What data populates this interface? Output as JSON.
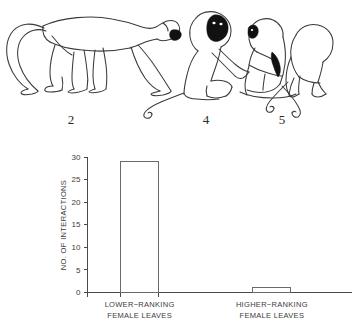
{
  "figure": {
    "illustration": {
      "panels": [
        {
          "number": "2",
          "caption_icon": "monkey-walking-icon"
        },
        {
          "number": "4",
          "caption_icon": "monkey-pair-grooming-icon"
        },
        {
          "number": "5",
          "caption_icon": "monkey-sitting-icon"
        }
      ]
    }
  },
  "chart_data": {
    "type": "bar",
    "title": "",
    "xlabel": "",
    "ylabel": "NO. OF INTERACTIONS",
    "categories": [
      "LOWER−RANKING FEMALE LEAVES",
      "HIGHER−RANKING FEMALE LEAVES"
    ],
    "category_lines": [
      [
        "LOWER−RANKING",
        "FEMALE LEAVES"
      ],
      [
        "HIGHER−RANKING",
        "FEMALE LEAVES"
      ]
    ],
    "values": [
      29,
      1
    ],
    "ylim": [
      0,
      30
    ],
    "yticks": [
      0,
      5,
      10,
      15,
      20,
      25,
      30
    ],
    "ytick_labels": [
      "0",
      "5",
      "10",
      "15",
      "20",
      "25",
      "30"
    ],
    "grid": false,
    "legend": false,
    "bar_fill": "#ffffff",
    "bar_stroke": "#6a6a6a",
    "axis_color": "#4a4a4a"
  }
}
